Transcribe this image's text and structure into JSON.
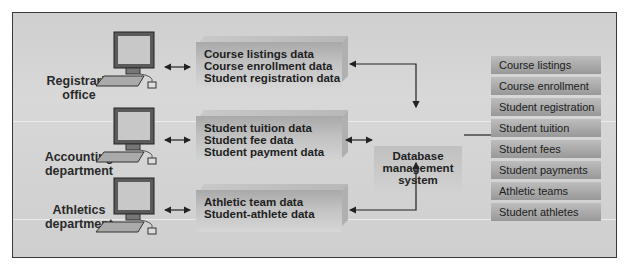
{
  "departments": [
    {
      "name": "Registrar's office",
      "line1": "Registrar's",
      "line2": "office",
      "data": [
        "Course listings data",
        "Course enrollment data",
        "Student registration data"
      ]
    },
    {
      "name": "Accounting department",
      "line1": "Accounting",
      "line2": "department",
      "data": [
        "Student tuition data",
        "Student fee data",
        "Student payment data"
      ]
    },
    {
      "name": "Athletics department",
      "line1": "Athletics",
      "line2": "department",
      "data": [
        "Athletic team data",
        "Student-athlete data"
      ]
    }
  ],
  "dbms": {
    "line1": "Database",
    "line2": "management",
    "line3": "system"
  },
  "database_tables": [
    "Course listings",
    "Course enrollment",
    "Student registration",
    "Student tuition",
    "Student fees",
    "Student payments",
    "Athletic teams",
    "Student athletes"
  ],
  "icons": {
    "computer": "desktop-computer-icon"
  }
}
